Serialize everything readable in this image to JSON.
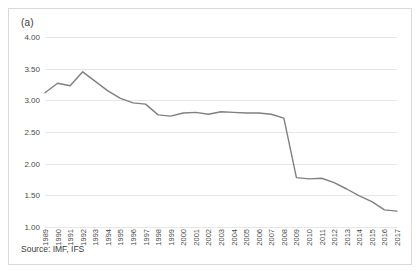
{
  "figure": {
    "panel_label": "(a)",
    "source_note": "Source: IMF, IFS",
    "stray_mark": "′",
    "line_color": "#808080",
    "grid_color": "#e6e6e6",
    "border_color": "#d9d9d9",
    "background": "#ffffff"
  },
  "chart_data": {
    "type": "line",
    "title": "",
    "subtitle": "",
    "xlabel": "",
    "ylabel": "",
    "annotations": [
      "(a)",
      "Source: IMF, IFS"
    ],
    "grid": true,
    "grid_axis": "y",
    "legend": false,
    "legend_position": "none",
    "ylim": [
      1.0,
      4.0
    ],
    "ytick_labels": [
      "4.00",
      "3.50",
      "3.00",
      "2.50",
      "2.00",
      "1.50",
      "1.00"
    ],
    "yticks": [
      4.0,
      3.5,
      3.0,
      2.5,
      2.0,
      1.5,
      1.0
    ],
    "categories": [
      "1989",
      "1990",
      "1991",
      "1992",
      "1993",
      "1994",
      "1995",
      "1996",
      "1997",
      "1998",
      "1999",
      "2000",
      "2001",
      "2002",
      "2003",
      "2004",
      "2005",
      "2006",
      "2007",
      "2008",
      "2009",
      "2010",
      "2011",
      "2012",
      "2013",
      "2014",
      "2015",
      "2016",
      "2017"
    ],
    "series": [
      {
        "name": "series-1",
        "color": "#808080",
        "values": [
          3.12,
          3.27,
          3.23,
          3.45,
          3.3,
          3.15,
          3.03,
          2.96,
          2.94,
          2.77,
          2.75,
          2.8,
          2.81,
          2.78,
          2.82,
          2.81,
          2.8,
          2.8,
          2.78,
          2.72,
          1.78,
          1.76,
          1.77,
          1.7,
          1.6,
          1.49,
          1.4,
          1.27,
          1.25
        ]
      }
    ]
  }
}
